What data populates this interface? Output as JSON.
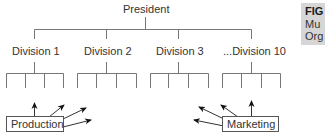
{
  "diagram": {
    "top_node": "President",
    "divisions": [
      "Division 1",
      "Division 2",
      "Division 3",
      "...Division 10"
    ],
    "function_boxes": {
      "left": "Production",
      "right": "Marketing"
    },
    "line_color": "#666666"
  },
  "figure_caption": {
    "title": "FIG",
    "line1": "Mu",
    "line2": "Org"
  }
}
